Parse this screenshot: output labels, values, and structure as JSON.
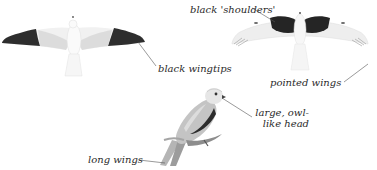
{
  "figure": {
    "views": [
      {
        "id": "underside-flight",
        "description": "bird in flight seen from below"
      },
      {
        "id": "upperside-flight",
        "description": "bird in flight seen from above"
      },
      {
        "id": "perched",
        "description": "bird perched on branch"
      }
    ]
  },
  "labels": {
    "black_wingtips": "black wingtips",
    "black_shoulders": "black 'shoulders'",
    "pointed_wings": "pointed wings",
    "large_owl_head_line1": "large, owl-",
    "large_owl_head_line2": "like head",
    "long_wings": "long wings"
  },
  "colors": {
    "background": "#ffffff",
    "black_markings": "#2b2b2b",
    "grey_plumage": "#b8b8b8",
    "light_plumage": "#eeeeee",
    "leader_line": "#555555",
    "label_text": "#2a2a2a"
  }
}
